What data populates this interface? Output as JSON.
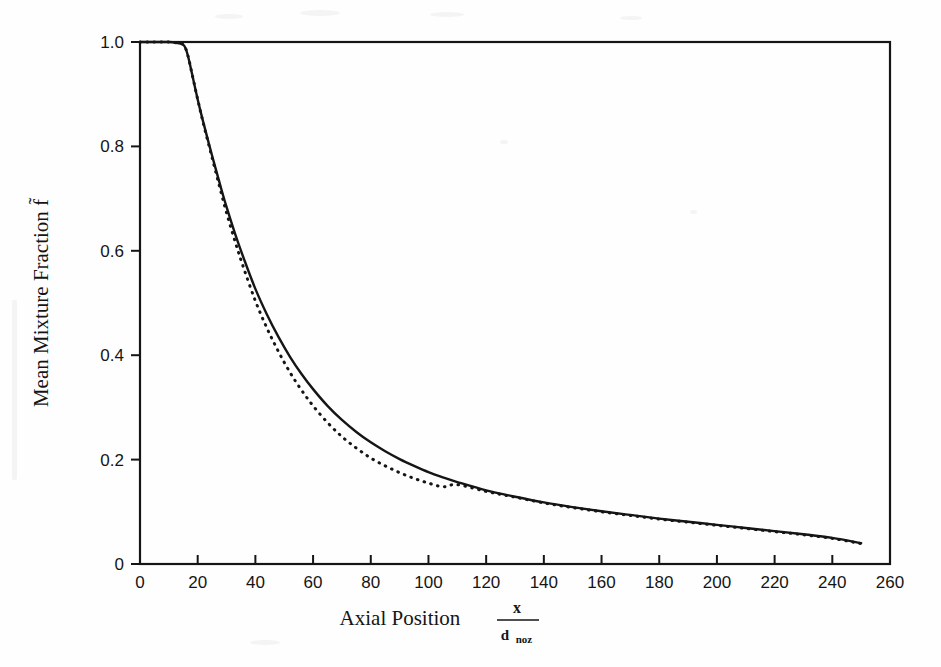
{
  "figure": {
    "background_color": "#fefefe",
    "ink_color": "#151515"
  },
  "chart_data": {
    "type": "line",
    "title": "",
    "subtitle": "",
    "xlabel": "Axial Position",
    "xlabel_fraction_numerator": "x",
    "xlabel_fraction_denominator": "d",
    "xlabel_fraction_denominator_subscript": "noz",
    "ylabel": "Mean Mixture Fraction f̃",
    "ylabel_plain": "Mean Mixture Fraction f",
    "ylabel_accent": "tilde",
    "xlim": [
      0,
      260
    ],
    "ylim": [
      0,
      1.0
    ],
    "xticks": [
      0,
      20,
      40,
      60,
      80,
      100,
      120,
      140,
      160,
      180,
      200,
      220,
      240,
      260
    ],
    "xtick_labels": [
      "0",
      "20",
      "40",
      "60",
      "80",
      "100",
      "120",
      "140",
      "160",
      "180",
      "200",
      "220",
      "240",
      "260"
    ],
    "yticks": [
      0,
      0.2,
      0.4,
      0.6,
      0.8,
      1.0
    ],
    "ytick_labels": [
      "0",
      "0.2",
      "0.4",
      "0.6",
      "0.8",
      "1.0"
    ],
    "grid": false,
    "legend": false,
    "legend_position": "none",
    "frame": "box",
    "series": [
      {
        "name": "solid-curve",
        "style": "solid",
        "color": "#151515",
        "x": [
          0,
          5,
          10,
          13,
          15,
          16,
          17,
          18,
          20,
          22,
          25,
          28,
          30,
          33,
          36,
          40,
          44,
          48,
          52,
          56,
          60,
          65,
          70,
          75,
          80,
          85,
          90,
          95,
          100,
          105,
          110,
          120,
          130,
          140,
          150,
          160,
          170,
          180,
          190,
          200,
          210,
          220,
          230,
          240,
          250
        ],
        "y": [
          1.0,
          1.0,
          1.0,
          0.998,
          0.995,
          0.985,
          0.965,
          0.94,
          0.89,
          0.845,
          0.782,
          0.722,
          0.684,
          0.632,
          0.585,
          0.527,
          0.478,
          0.435,
          0.397,
          0.364,
          0.335,
          0.303,
          0.276,
          0.253,
          0.233,
          0.216,
          0.201,
          0.188,
          0.176,
          0.166,
          0.157,
          0.141,
          0.129,
          0.118,
          0.109,
          0.101,
          0.094,
          0.087,
          0.081,
          0.075,
          0.069,
          0.063,
          0.057,
          0.05,
          0.04
        ]
      },
      {
        "name": "dotted-curve",
        "style": "dotted",
        "color": "#151515",
        "x": [
          0,
          5,
          10,
          13,
          15,
          16,
          17,
          18,
          20,
          22,
          25,
          28,
          30,
          33,
          36,
          40,
          44,
          48,
          52,
          56,
          60,
          65,
          70,
          75,
          80,
          85,
          90,
          95,
          100,
          105,
          110,
          120,
          130,
          140,
          150,
          160,
          170,
          180,
          190,
          200,
          210,
          220,
          230,
          240,
          250
        ],
        "y": [
          1.0,
          1.0,
          1.0,
          0.998,
          0.995,
          0.985,
          0.965,
          0.94,
          0.89,
          0.843,
          0.778,
          0.714,
          0.673,
          0.617,
          0.566,
          0.504,
          0.452,
          0.407,
          0.367,
          0.333,
          0.303,
          0.271,
          0.244,
          0.222,
          0.203,
          0.188,
          0.175,
          0.164,
          0.155,
          0.148,
          0.152,
          0.139,
          0.128,
          0.117,
          0.108,
          0.1,
          0.093,
          0.086,
          0.08,
          0.074,
          0.068,
          0.062,
          0.056,
          0.049,
          0.039
        ]
      }
    ],
    "annotations": []
  }
}
